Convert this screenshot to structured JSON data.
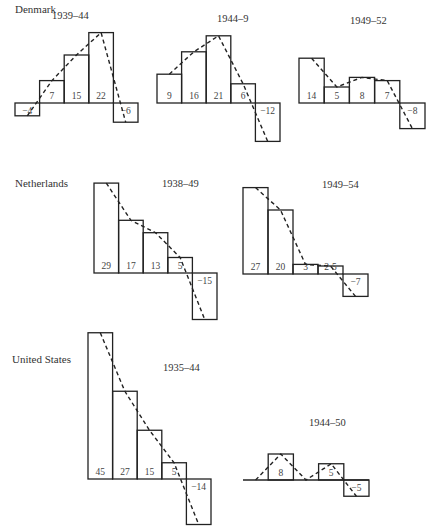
{
  "chart_data": [
    {
      "type": "bar",
      "country": "Denmark",
      "title": "1939-44",
      "values": [
        -4,
        7,
        15,
        22,
        -6
      ],
      "labels": [
        "−4",
        "7",
        "15",
        "22",
        "−6"
      ],
      "trend_line": "dashed",
      "geom": {
        "x0": 15,
        "bw": 24.6,
        "base": 103,
        "scale": 3.2,
        "title_x": 52,
        "title_y": 19
      }
    },
    {
      "type": "bar",
      "country": "Denmark",
      "title": "1944-9",
      "values": [
        9,
        16,
        21,
        6,
        -12
      ],
      "labels": [
        "9",
        "16",
        "21",
        "6",
        "−12"
      ],
      "trend_line": "dashed",
      "geom": {
        "x0": 157,
        "bw": 24.6,
        "base": 103,
        "scale": 3.2,
        "title_x": 217,
        "title_y": 22
      }
    },
    {
      "type": "bar",
      "country": "Denmark",
      "title": "1949-52",
      "values": [
        14,
        5,
        8,
        7,
        -8
      ],
      "labels": [
        "14",
        "5",
        "8",
        "7",
        "−8"
      ],
      "trend_line": "dashed",
      "geom": {
        "x0": 299,
        "bw": 25.2,
        "base": 103,
        "scale": 3.2,
        "title_x": 350,
        "title_y": 24
      }
    },
    {
      "type": "bar",
      "country": "Netherlands",
      "title": "1938-49",
      "values": [
        29,
        17,
        13,
        5,
        -15
      ],
      "labels": [
        "29",
        "17",
        "13",
        "5",
        "−15"
      ],
      "trend_line": "dashed",
      "geom": {
        "x0": 94,
        "bw": 24.6,
        "base": 273,
        "scale": 3.1,
        "title_x": 162,
        "title_y": 187
      }
    },
    {
      "type": "bar",
      "country": "Netherlands",
      "title": "1949-54",
      "values": [
        27,
        20,
        3,
        2.5,
        -7
      ],
      "labels": [
        "27",
        "20",
        "3",
        "2·5",
        "−7"
      ],
      "trend_line": "dashed",
      "geom": {
        "x0": 243,
        "bw": 25,
        "base": 274,
        "scale": 3.2,
        "title_x": 322,
        "title_y": 188
      }
    },
    {
      "type": "bar",
      "country": "United States",
      "title": "1935-44",
      "values": [
        45,
        27,
        15,
        5,
        -14
      ],
      "labels": [
        "45",
        "27",
        "15",
        "5",
        "−14"
      ],
      "trend_line": "dashed",
      "geom": {
        "x0": 88,
        "bw": 24.6,
        "base": 479,
        "scale": 3.25,
        "title_x": 163,
        "title_y": 371
      }
    },
    {
      "type": "bar",
      "country": "United States",
      "title": "1944-50",
      "values": [
        0,
        8,
        0,
        5,
        -5
      ],
      "labels": [
        "",
        "8",
        "",
        "5",
        "−5"
      ],
      "trend_line": "dashed",
      "geom": {
        "x0": 243,
        "bw": 25.2,
        "base": 480,
        "scale": 3.25,
        "title_x": 309,
        "title_y": 426
      }
    }
  ],
  "countries": {
    "denmark": "Denmark",
    "netherlands": "Netherlands",
    "united_states": "United States"
  }
}
